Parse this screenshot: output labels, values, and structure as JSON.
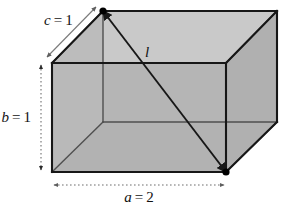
{
  "figure": {
    "kind": "geometry-diagram",
    "labels": {
      "width_label": "a = 2",
      "height_label": "b = 1",
      "depth_label": "c = 1",
      "diagonal_label": "l"
    },
    "label_parts": {
      "width_var": "a",
      "width_eq": "=",
      "width_val": "2",
      "height_var": "b",
      "height_eq": "=",
      "height_val": "1",
      "depth_var": "c",
      "depth_eq": "=",
      "depth_val": "1",
      "diagonal_var": "l"
    },
    "colors": {
      "background": "#ffffff",
      "top_face": "#c9c9c9",
      "back_face": "#b4b4b4",
      "right_face": "#b0b0b0",
      "left_face": "#b8b8b8",
      "bottom_face": "#adadad",
      "front_top_band": "#bdbdbd",
      "edge": "#1a1a1a",
      "thin_edge": "#4a4a4a",
      "dimension_arrow": "#6e6e6e",
      "text": "#111111",
      "vertex_dot": "#000000"
    },
    "geometry": {
      "front_top_left": [
        52,
        63
      ],
      "front_top_right": [
        226,
        63
      ],
      "front_bottom_left": [
        52,
        172
      ],
      "front_bottom_right": [
        226,
        172
      ],
      "back_top_left": [
        103,
        11
      ],
      "back_top_right": [
        277,
        11
      ],
      "back_bottom_left": [
        103,
        122
      ],
      "back_bottom_right": [
        277,
        122
      ],
      "diagonal_from": [
        103,
        11
      ],
      "diagonal_to": [
        226,
        172
      ]
    },
    "dimension_lines": {
      "width": {
        "from": [
          52,
          185
        ],
        "to": [
          226,
          185
        ],
        "style": "dotted-double-arrow"
      },
      "height": {
        "from": [
          41,
          63
        ],
        "to": [
          41,
          172
        ],
        "style": "dotted-double-arrow"
      },
      "depth": {
        "from": [
          46,
          58
        ],
        "to": [
          97,
          6
        ],
        "style": "solid-double-arrow"
      }
    }
  }
}
